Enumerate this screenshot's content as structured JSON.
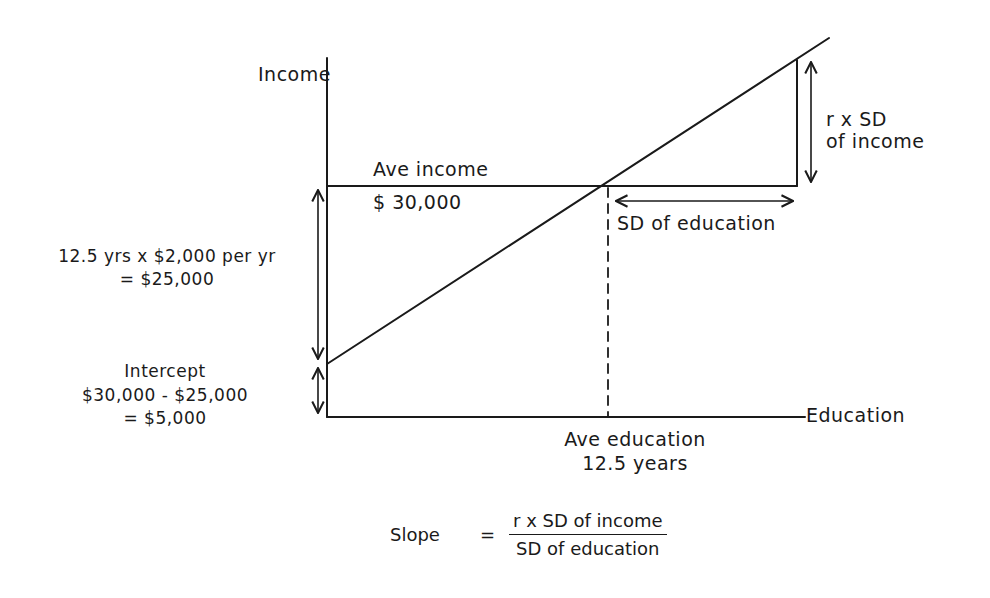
{
  "diagram": {
    "type": "regression-line-explanation",
    "axes": {
      "y_label": "Income",
      "x_label": "Education"
    },
    "average_income": {
      "label": "Ave income",
      "value": "$ 30,000"
    },
    "average_education": {
      "label": "Ave education",
      "value": "12.5 years"
    },
    "rise_annotation": {
      "line1": "r x SD",
      "line2": "of income"
    },
    "run_annotation": "SD of education",
    "drop_annotation": {
      "line1": "12.5 yrs x $2,000 per yr",
      "line2": "= $25,000"
    },
    "intercept_annotation": {
      "line1": "Intercept",
      "line2": "$30,000 - $25,000",
      "line3": "= $5,000"
    },
    "slope_formula": {
      "lhs": "Slope",
      "equals": "=",
      "numerator": "r x SD of income",
      "denominator": "SD of education"
    },
    "colors": {
      "ink": "#1a1a1a",
      "background": "#ffffff"
    }
  }
}
